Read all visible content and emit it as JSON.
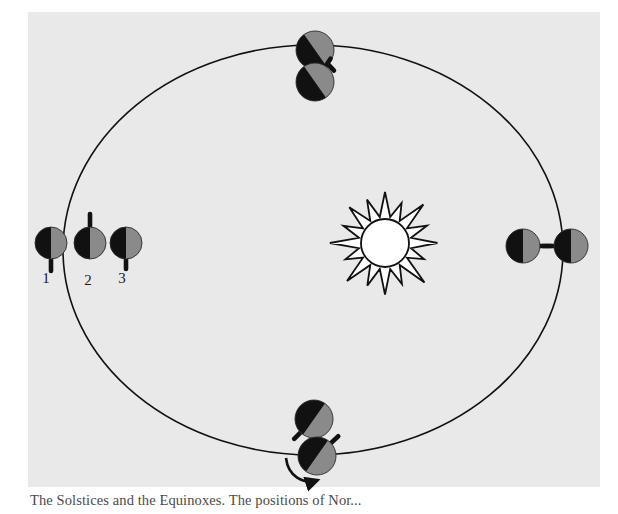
{
  "figure": {
    "kind": "astronomy-diagram",
    "caption": "The Solstices and the Equinoxes. The positions of Nor...",
    "plate_color": "#e9e9e9",
    "page_color": "#ffffff",
    "ink_color": "#111111",
    "day_color": "#8a8a8a",
    "night_color": "#111111"
  },
  "orbit": {
    "name": "orbit-ellipse",
    "center_x": 313,
    "center_y": 250,
    "radius_x": 250,
    "radius_y": 205,
    "stroke_width": 1.6
  },
  "sun": {
    "name": "sun",
    "center_x": 385,
    "center_y": 243,
    "core_radius": 24,
    "ray_count": 16,
    "ray_length": 27,
    "fill": "#ffffff",
    "stroke": "#111111"
  },
  "rotation_arrow": {
    "name": "rotation-arrow",
    "label": "",
    "direction": "counterclockwise"
  },
  "position_labels": [
    {
      "id": "1",
      "label": "1",
      "x": 46,
      "y": 283
    },
    {
      "id": "2",
      "label": "2",
      "x": 88,
      "y": 285
    },
    {
      "id": "3",
      "label": "3",
      "x": 122,
      "y": 283
    }
  ],
  "earths": [
    {
      "name": "earth-left-outer",
      "station": "left",
      "cx": 51,
      "cy": 243,
      "r": 16,
      "split_angle_deg": 90,
      "night_side": "left",
      "axis_dx": 0,
      "axis_dy": 16,
      "axis_len": 12,
      "labelled": "1"
    },
    {
      "name": "earth-left-middle",
      "station": "left",
      "cx": 90,
      "cy": 243,
      "r": 16,
      "split_angle_deg": 90,
      "night_side": "left",
      "axis_dx": 0,
      "axis_dy": -16,
      "axis_len": 13,
      "labelled": "2"
    },
    {
      "name": "earth-left-inner",
      "station": "left",
      "cx": 126,
      "cy": 243,
      "r": 16,
      "split_angle_deg": 90,
      "night_side": "left",
      "axis_dx": 0,
      "axis_dy": 16,
      "axis_len": 10,
      "labelled": "3"
    },
    {
      "name": "earth-top-outer",
      "station": "top",
      "cx": 315,
      "cy": 50,
      "r": 19,
      "split_angle_deg": 55,
      "night_side": "upper-left",
      "axis_dx": 12,
      "axis_dy": 13,
      "axis_len": 9,
      "labelled": ""
    },
    {
      "name": "earth-top-inner",
      "station": "top",
      "cx": 315,
      "cy": 82,
      "r": 19,
      "split_angle_deg": 55,
      "night_side": "upper-left",
      "axis_dx": 10,
      "axis_dy": -15,
      "axis_len": 9,
      "labelled": ""
    },
    {
      "name": "earth-right-inner",
      "station": "right",
      "cx": 523,
      "cy": 246,
      "r": 17,
      "split_angle_deg": 90,
      "night_side": "right",
      "axis_dx": 17,
      "axis_dy": 0,
      "axis_len": 11,
      "labelled": ""
    },
    {
      "name": "earth-right-outer",
      "station": "right",
      "cx": 571,
      "cy": 246,
      "r": 17,
      "split_angle_deg": 90,
      "night_side": "right",
      "axis_dx": -17,
      "axis_dy": 0,
      "axis_len": 11,
      "labelled": ""
    },
    {
      "name": "earth-bottom-outer",
      "station": "bottom",
      "cx": 314,
      "cy": 419,
      "r": 19,
      "split_angle_deg": 125,
      "night_side": "lower-left",
      "axis_dx": -13,
      "axis_dy": 13,
      "axis_len": 9,
      "labelled": ""
    },
    {
      "name": "earth-bottom-inner",
      "station": "bottom",
      "cx": 317,
      "cy": 456,
      "r": 19,
      "split_angle_deg": 125,
      "night_side": "lower-left",
      "axis_dx": 14,
      "axis_dy": -13,
      "axis_len": 10,
      "labelled": ""
    }
  ]
}
